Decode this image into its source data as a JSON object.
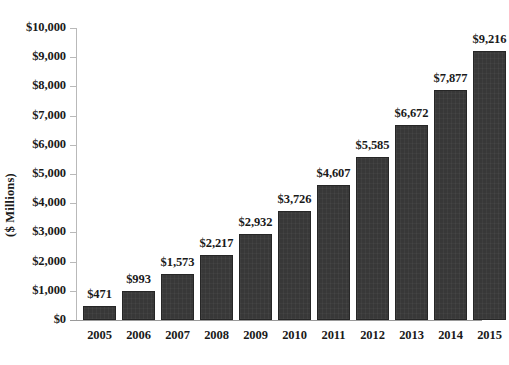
{
  "chart_data": {
    "type": "bar",
    "title": "",
    "subtitle": "",
    "xlabel": "",
    "ylabel": "($ Millions)",
    "categories": [
      "2005",
      "2006",
      "2007",
      "2008",
      "2009",
      "2010",
      "2011",
      "2012",
      "2013",
      "2014",
      "2015"
    ],
    "values": [
      471,
      993,
      1573,
      2217,
      2932,
      3726,
      4607,
      5585,
      6672,
      7877,
      9216
    ],
    "value_labels": [
      "$471",
      "$993",
      "$1,573",
      "$2,217",
      "$2,932",
      "$3,726",
      "$4,607",
      "$5,585",
      "$6,672",
      "$7,877",
      "$9,216"
    ],
    "ylim": [
      0,
      10000
    ],
    "ytick_values": [
      0,
      1000,
      2000,
      3000,
      4000,
      5000,
      6000,
      7000,
      8000,
      9000,
      10000
    ],
    "ytick_labels": [
      "$0",
      "$1,000",
      "$2,000",
      "$3,000",
      "$4,000",
      "$5,000",
      "$6,000",
      "$7,000",
      "$8,000",
      "$9,000",
      "$10,000"
    ],
    "grid": false,
    "legend": false,
    "legend_position": "none",
    "series": [
      {
        "name": "",
        "values": [
          471,
          993,
          1573,
          2217,
          2932,
          3726,
          4607,
          5585,
          6672,
          7877,
          9216
        ]
      }
    ],
    "colors": {
      "bar_fill": "#383838",
      "bar_border": "#262626",
      "text": "#1a1a1a",
      "axis": "#b9b9b9",
      "background": "#ffffff"
    }
  }
}
